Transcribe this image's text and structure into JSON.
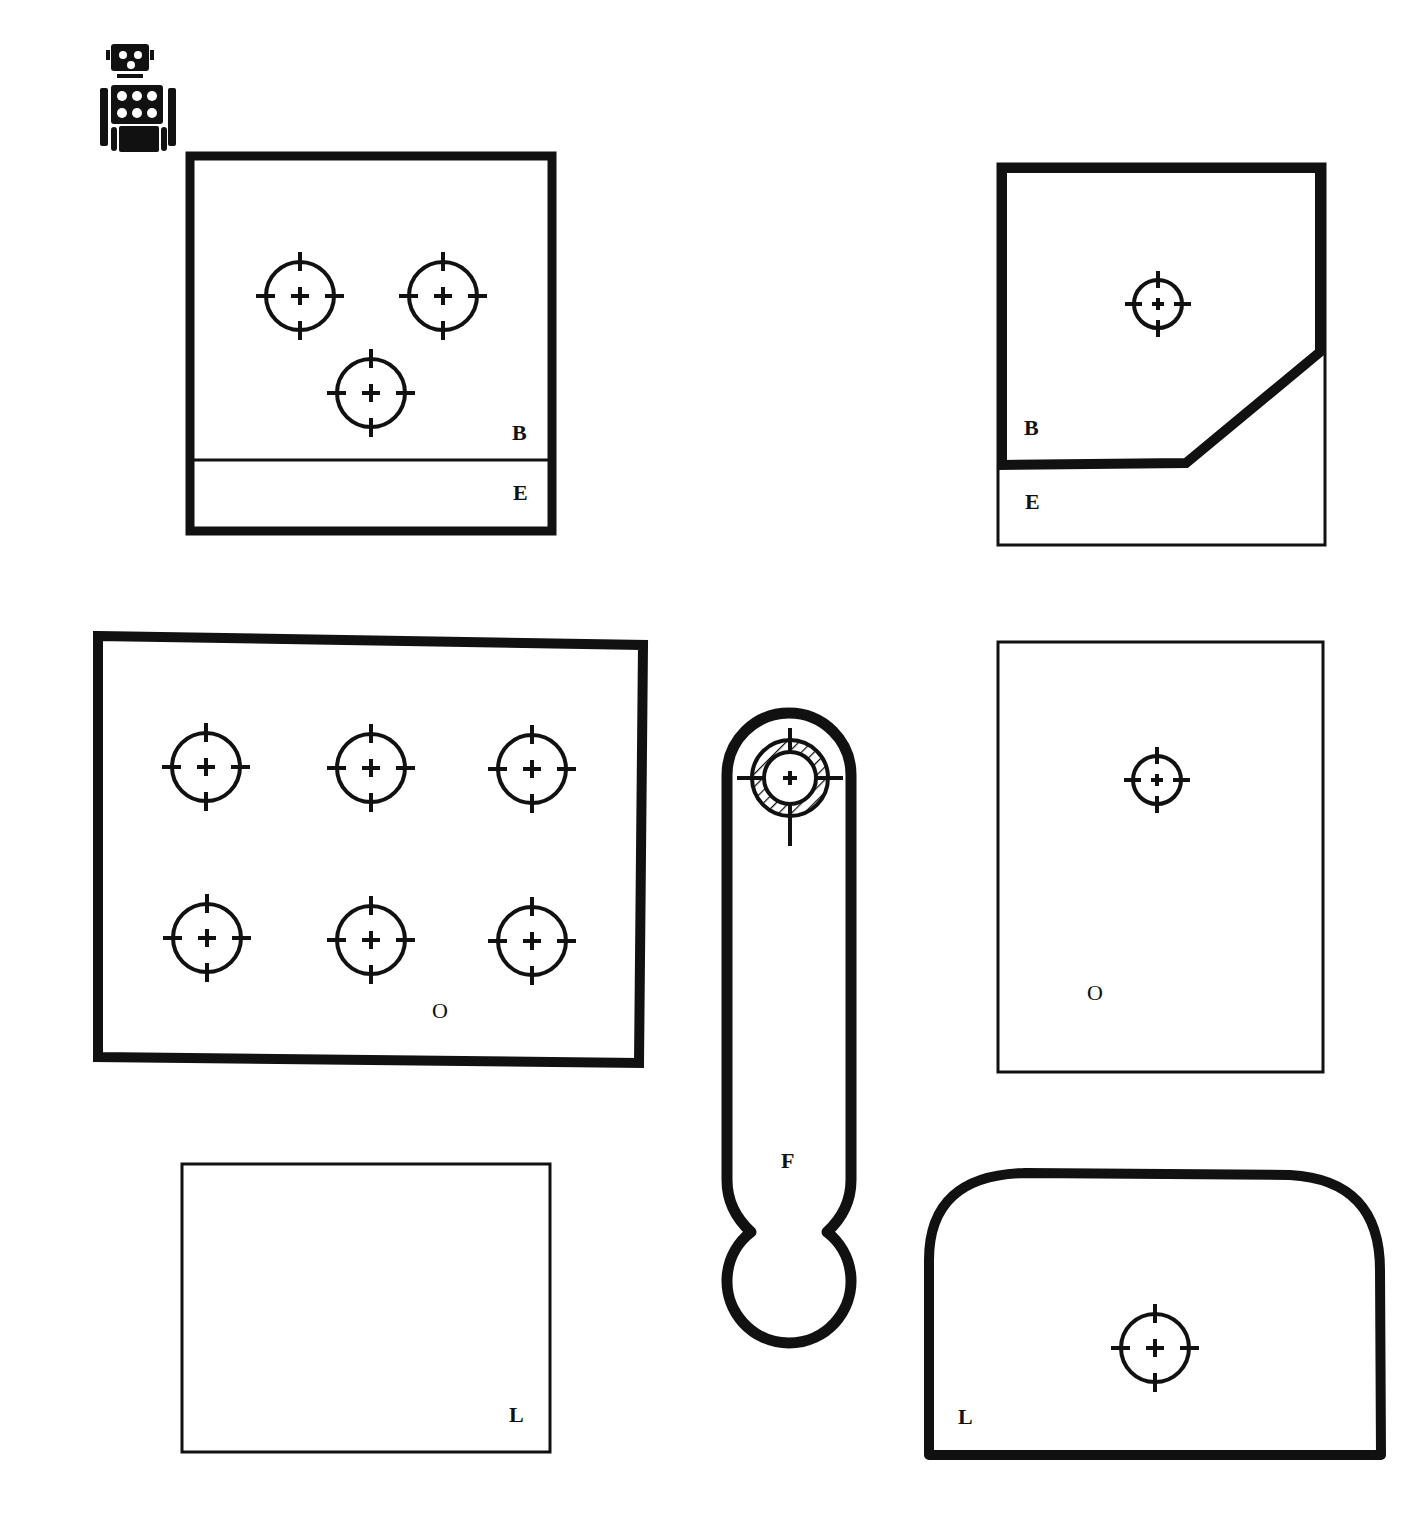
{
  "colors": {
    "ink": "#111111",
    "paper": "#ffffff"
  },
  "logo": {
    "icon": "robot-icon"
  },
  "parts": [
    {
      "id": "part-1",
      "shape": "square-plate-with-band",
      "labels": [
        "B",
        "E"
      ],
      "crosshairs": 3
    },
    {
      "id": "part-2",
      "shape": "chamfered-plate",
      "labels": [
        "B",
        "E"
      ],
      "crosshairs": 1
    },
    {
      "id": "part-3",
      "shape": "rectangular-plate",
      "labels": [
        "O"
      ],
      "crosshairs": 6
    },
    {
      "id": "part-4",
      "shape": "connecting-rod",
      "labels": [
        "F"
      ],
      "crosshairs": 1
    },
    {
      "id": "part-5",
      "shape": "tall-plate",
      "labels": [
        "O"
      ],
      "crosshairs": 1
    },
    {
      "id": "part-6",
      "shape": "thin-rectangle",
      "labels": [
        "L"
      ],
      "crosshairs": 0
    },
    {
      "id": "part-7",
      "shape": "rounded-top-plate",
      "labels": [
        "L"
      ],
      "crosshairs": 1
    }
  ],
  "labels": {
    "p1_b": "B",
    "p1_e": "E",
    "p2_b": "B",
    "p2_e": "E",
    "p3_o": "O",
    "p4_f": "F",
    "p5_o": "O",
    "p6_l": "L",
    "p7_l": "L"
  }
}
